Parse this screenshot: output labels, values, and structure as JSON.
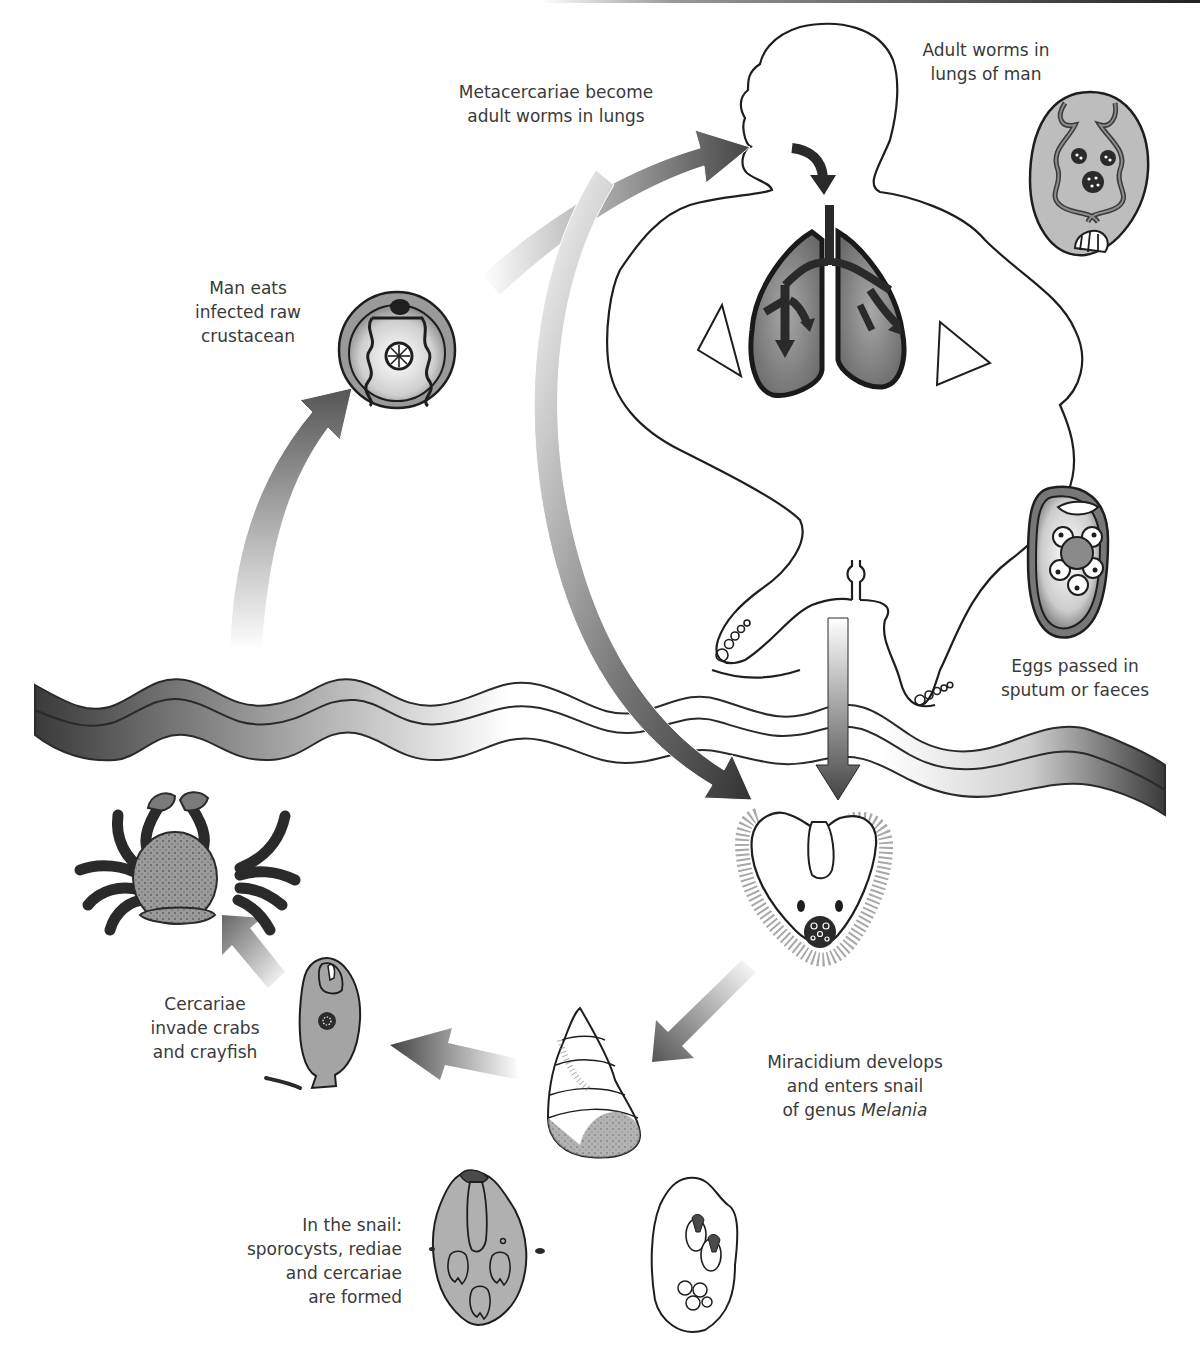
{
  "diagram": {
    "colors": {
      "outline": "#1e1e1e",
      "dark_fill": "#3c3c3c",
      "mid_fill": "#9a9a9a",
      "light_fill": "#bdbdbd",
      "text": "#3a3a3a",
      "background": "#ffffff"
    },
    "labels": {
      "adult_worms": {
        "lines": [
          "Adult worms in",
          "lungs of man"
        ]
      },
      "metacercariae": {
        "lines": [
          "Metacercariae become",
          "adult worms in lungs"
        ]
      },
      "man_eats": {
        "lines": [
          "Man eats",
          "infected raw",
          "crustacean"
        ]
      },
      "eggs_passed": {
        "lines": [
          "Eggs passed in",
          "sputum or faeces"
        ]
      },
      "miracidium": {
        "lines": [
          "Miracidium develops",
          "and enters snail"
        ],
        "line3_prefix": "of genus ",
        "line3_italic": "Melania"
      },
      "cercariae": {
        "lines": [
          "Cercariae",
          "invade crabs",
          "and crayfish"
        ]
      },
      "in_snail": {
        "lines": [
          "In the snail:",
          "sporocysts, rediae",
          "and cercariae",
          "are formed"
        ]
      }
    },
    "stages": [
      {
        "id": "adult-worm",
        "name": "Adult worm"
      },
      {
        "id": "egg",
        "name": "Egg"
      },
      {
        "id": "miracidium",
        "name": "Miracidium"
      },
      {
        "id": "snail",
        "name": "Snail (Melania)"
      },
      {
        "id": "redia",
        "name": "Redia"
      },
      {
        "id": "sporocyst",
        "name": "Sporocyst"
      },
      {
        "id": "cercaria",
        "name": "Cercaria"
      },
      {
        "id": "crab",
        "name": "Crab / crayfish"
      },
      {
        "id": "metacercaria",
        "name": "Metacercaria"
      },
      {
        "id": "human-host",
        "name": "Human host"
      }
    ]
  }
}
